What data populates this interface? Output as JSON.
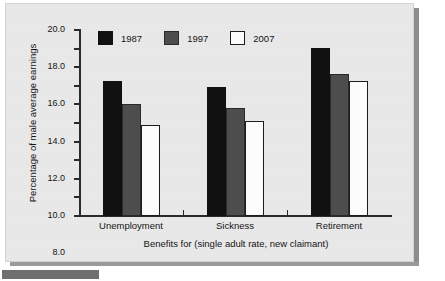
{
  "chart_data": {
    "type": "bar",
    "title": "",
    "xlabel": "Benefits for (single adult rate, new claimant)",
    "ylabel": "Percentage of male average earnings",
    "categories": [
      "Unemployment",
      "Sickness",
      "Retirement"
    ],
    "series": [
      {
        "name": "1987",
        "color": "#111111",
        "values": [
          14.5,
          13.9,
          18.1
        ]
      },
      {
        "name": "1997",
        "color": "#4d4d4d",
        "values": [
          12.0,
          11.6,
          15.3
        ]
      },
      {
        "name": "2007",
        "color": "#fcfcfc",
        "values": [
          9.8,
          10.2,
          14.5
        ]
      }
    ],
    "ylim": [
      0,
      20
    ],
    "ytick_step": 2,
    "ytick_labels": [
      "0.0",
      "2.0",
      "4.0",
      "6.0",
      "8.0",
      "10.0",
      "12.0",
      "14.0",
      "16.0",
      "18.0",
      "20.0"
    ],
    "grid": false,
    "legend_position": "top-left-inside"
  },
  "figure": {
    "background_color": "#e9e9e9",
    "axis_color": "#2b2b2b",
    "text_color": "#141414"
  }
}
